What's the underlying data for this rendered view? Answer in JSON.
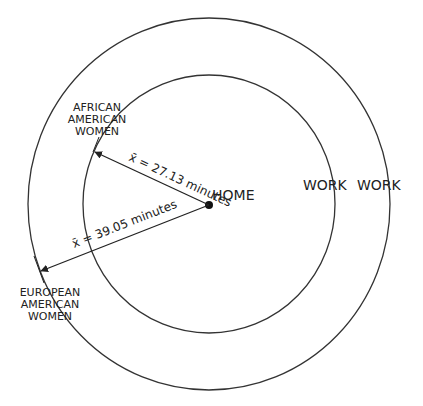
{
  "diagram": {
    "colors": {
      "line": "#333333",
      "text": "#222222",
      "background": "#ffffff"
    },
    "center": {
      "label": "HOME"
    },
    "inner_circle": {
      "group": [
        "AFRICAN",
        "AMERICAN",
        "WOMEN"
      ],
      "radius_label": "x̄ = 27.13 minutes",
      "mean_minutes": 27.13
    },
    "outer_circle": {
      "group": [
        "EUROPEAN",
        "AMERICAN",
        "WOMEN"
      ],
      "radius_label": "x̄ = 39.05 minutes",
      "mean_minutes": 39.05
    },
    "work_labels": [
      "WORK",
      "WORK"
    ]
  }
}
